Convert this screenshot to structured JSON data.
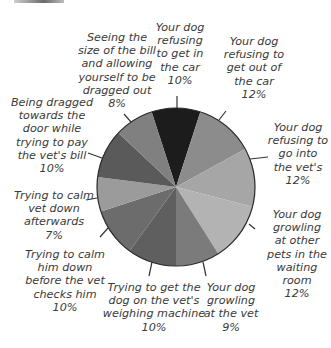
{
  "chart_data": {
    "type": "pie",
    "title": "",
    "start_angle_deg": -18,
    "direction": "clockwise",
    "slices": [
      {
        "label": "Your dog refusing to get in the car",
        "value": 10,
        "color": "#1c1c1c"
      },
      {
        "label": "Your dog refusing to get out of the car",
        "value": 12,
        "color": "#8c8c8c"
      },
      {
        "label": "Your dog refusing to go into the vet's",
        "value": 12,
        "color": "#a6a6a6"
      },
      {
        "label": "Your dog growling at other pets in the waiting room",
        "value": 12,
        "color": "#b3b3b3"
      },
      {
        "label": "Your dog growling at the vet",
        "value": 9,
        "color": "#7b7b7b"
      },
      {
        "label": "Trying to get the dog on the vet's weighing machine",
        "value": 10,
        "color": "#5f5f5f"
      },
      {
        "label": "Trying to calm him down before the vet checks him",
        "value": 10,
        "color": "#6c6c6c"
      },
      {
        "label": "Trying to calm vet down afterwards",
        "value": 7,
        "color": "#9b9b9b"
      },
      {
        "label": "Being dragged towards the door while trying to pay the vet's bill",
        "value": 10,
        "color": "#5a5a5a"
      },
      {
        "label": "Seeing the size of the bill and allowing yourself to be dragged out",
        "value": 8,
        "color": "#808080"
      }
    ],
    "legend": "none (callout labels)",
    "grid": false
  },
  "labels": {
    "get_in_car": "Your dog\nrefusing\nto get in\nthe car\n10%",
    "get_out_car": "Your dog\nrefusing to\nget out of\nthe car\n12%",
    "into_vets": "Your dog\nrefusing to\ngo into\nthe vet's\n12%",
    "growl_pets": "Your dog\ngrowling\nat other\npets in the\nwaiting\nroom\n12%",
    "growl_vet": "Your dog\ngrowling\nat the vet\n9%",
    "weighing": "Trying to get the\ndog on the vet's\nweighing machine\n10%",
    "calm_before": "Trying to calm\nhim down\nbefore the vet\nchecks him\n10%",
    "calm_after": "Trying to calm\nvet down\nafterwards\n7%",
    "dragged": "Being dragged\ntowards the\ndoor while\ntrying to pay\nthe vet's bill\n10%",
    "seeing_bill": "Seeing the\nsize of the bill\nand allowing\nyourself to be\ndragged out\n8%"
  }
}
